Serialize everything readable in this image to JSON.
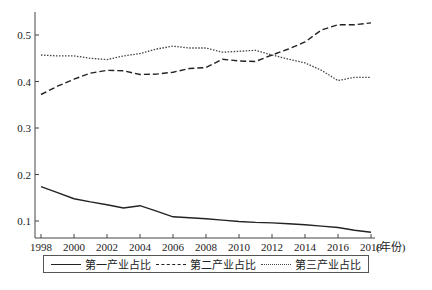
{
  "chart_data": {
    "type": "line",
    "title": "",
    "xlabel": "(年份)",
    "ylabel": "",
    "x": [
      1998,
      1999,
      2000,
      2001,
      2002,
      2003,
      2004,
      2005,
      2006,
      2007,
      2008,
      2009,
      2010,
      2011,
      2012,
      2013,
      2014,
      2015,
      2016,
      2017,
      2018
    ],
    "x_ticks": [
      "1998",
      "2000",
      "2002",
      "2004",
      "2006",
      "2008",
      "2010",
      "2012",
      "2014",
      "2016",
      "2018"
    ],
    "y_ticks": [
      "0.1",
      "0.2",
      "0.3",
      "0.4",
      "0.5"
    ],
    "ylim": [
      0.065,
      0.54
    ],
    "xlim": [
      1998,
      2018
    ],
    "grid": false,
    "legend_position": "bottom",
    "series": [
      {
        "name": "第一产业占比",
        "style": "solid",
        "values": [
          0.174,
          0.161,
          0.148,
          0.141,
          0.135,
          0.128,
          0.133,
          0.121,
          0.109,
          0.107,
          0.105,
          0.102,
          0.099,
          0.097,
          0.096,
          0.094,
          0.092,
          0.089,
          0.086,
          0.08,
          0.076
        ]
      },
      {
        "name": "第二产业占比",
        "style": "dashed",
        "values": [
          0.372,
          0.39,
          0.405,
          0.418,
          0.424,
          0.423,
          0.415,
          0.416,
          0.42,
          0.428,
          0.43,
          0.448,
          0.444,
          0.443,
          0.457,
          0.47,
          0.485,
          0.511,
          0.522,
          0.522,
          0.526
        ]
      },
      {
        "name": "第三产业占比",
        "style": "dotted",
        "values": [
          0.457,
          0.455,
          0.455,
          0.45,
          0.447,
          0.455,
          0.46,
          0.47,
          0.476,
          0.472,
          0.472,
          0.463,
          0.465,
          0.467,
          0.457,
          0.448,
          0.44,
          0.424,
          0.402,
          0.409,
          0.409
        ]
      }
    ]
  },
  "legend": {
    "items": [
      {
        "label": "第一产业占比"
      },
      {
        "label": "第二产业占比"
      },
      {
        "label": "第三产业占比"
      }
    ]
  },
  "axis": {
    "x_unit_label": "(年份)"
  }
}
